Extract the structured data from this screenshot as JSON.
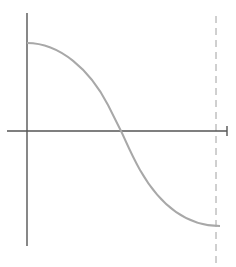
{
  "diagram": {
    "type": "function-plot",
    "colors": {
      "axis": "#555555",
      "curve": "#a8a8a8",
      "dashed_line": "#a0a0a0",
      "background": "#ffffff"
    },
    "axes": {
      "origin": [
        27,
        131
      ],
      "y_axis": {
        "top": 13,
        "bottom": 246
      },
      "x_axis": {
        "left": 7,
        "right": 227,
        "end_cap": true
      }
    },
    "curve": {
      "start": [
        27,
        43
      ],
      "zero_crossing": [
        121,
        131
      ],
      "end": [
        220,
        226
      ]
    },
    "dashed_line": {
      "x": 216,
      "top": 16,
      "bottom": 267
    }
  }
}
